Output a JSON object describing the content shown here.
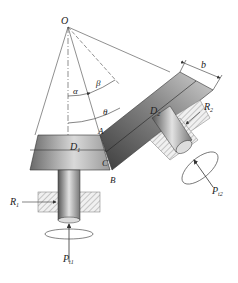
{
  "diagram": {
    "type": "bevel-gear-force-schematic",
    "apex_label": "O",
    "angles": {
      "alpha": "α",
      "beta": "β",
      "theta": "θ"
    },
    "points": {
      "A": "A",
      "B": "B",
      "C": "C"
    },
    "gear1": {
      "diameter_label": "D",
      "diameter_sub": "1",
      "reaction_label": "R",
      "reaction_sub": "1",
      "force_label": "P",
      "force_sub": "t1"
    },
    "gear2": {
      "diameter_label": "D",
      "diameter_sub": "2",
      "reaction_label": "R",
      "reaction_sub": "2",
      "force_label": "P",
      "force_sub": "t2"
    },
    "face_width_label": "b",
    "colors": {
      "line": "#333333",
      "gear_dark": "#4a4a4a",
      "gear_light": "#d8d8d8",
      "hatch": "#999999"
    }
  }
}
